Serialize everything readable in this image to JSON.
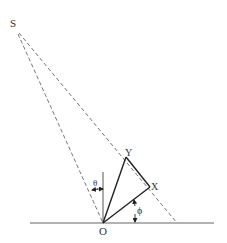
{
  "diagram": {
    "labels": {
      "S": "S",
      "Y": "Y",
      "X": "X",
      "O": "O",
      "theta": "θ",
      "phi": "ϕ"
    },
    "points": {
      "S": [
        17,
        32
      ],
      "Y": [
        126,
        157
      ],
      "X": [
        150,
        187
      ],
      "O": [
        103,
        223
      ],
      "far_end": [
        177,
        223
      ]
    },
    "baseline": {
      "x1": 30,
      "x2": 214,
      "y": 223
    },
    "vertical": {
      "x": 103,
      "y1": 172,
      "y2": 223
    },
    "colors": {
      "solid": "#222222",
      "dashed": "#555555",
      "baseline": "#666666",
      "text": "#333333"
    }
  }
}
